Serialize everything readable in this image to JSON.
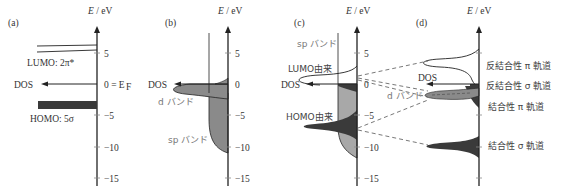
{
  "axis_label": "E / eV",
  "ticks": [
    "5",
    "0",
    "−5",
    "−10",
    "−15"
  ],
  "tick_values": [
    5,
    0,
    -5,
    -10,
    -15
  ],
  "panels": {
    "a": {
      "label": "(a)",
      "dos_label": "DOS",
      "lumo_label": "LUMO: 2π*",
      "homo_label": "HOMO: 5σ",
      "fermi_label": "0 = E",
      "fermi_sub": "F"
    },
    "b": {
      "label": "(b)",
      "dos_label": "DOS",
      "d_band_label": "d バンド",
      "sp_band_label": "sp バンド"
    },
    "c": {
      "label": "(c)",
      "dos_label": "DOS",
      "sp_band_label": "sp バンド",
      "lumo_origin_label": "LUMO由来",
      "homo_origin_label": "HOMO由来"
    },
    "d": {
      "label": "(d)",
      "dos_label": "DOS",
      "d_band_label": "d バンド",
      "antibonding_pi": "反結合性 π 軌道",
      "antibonding_sigma": "反結合性 σ 軌道",
      "bonding_pi": "結合性 π 軌道",
      "bonding_sigma": "結合性 σ 軌道"
    }
  },
  "colors": {
    "axis": "#222222",
    "dark_fill": "#3a3a3a",
    "medium_fill": "#8a8a8a",
    "light_fill": "#a8a8a8",
    "dashed": "#555555"
  }
}
